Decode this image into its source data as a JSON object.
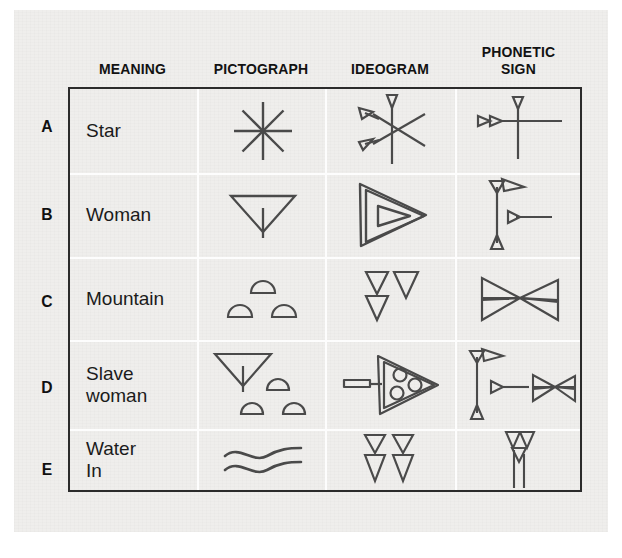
{
  "figure": {
    "type": "cuneiform-evolution-table",
    "headers": {
      "row_label": "",
      "meaning": "MEANING",
      "pictograph": "PICTOGRAPH",
      "ideogram": "IDEOGRAM",
      "phonetic_sign_line1": "PHONETIC",
      "phonetic_sign_line2": "SIGN"
    },
    "colors": {
      "paper": "#efeeec",
      "ink": "#2b2b2b",
      "grid": "#fdfdfd",
      "text": "#1b1b1b"
    },
    "rows": [
      {
        "letter": "A",
        "meaning": "Star",
        "meaning_line1": "Star",
        "meaning_line2": "",
        "pictograph": "eight-pointed-asterisk",
        "ideogram": "wedge-star-six-ray",
        "phonetic": "cross-with-two-wedges"
      },
      {
        "letter": "B",
        "meaning": "Woman",
        "meaning_line1": "Woman",
        "meaning_line2": "",
        "pictograph": "down-triangle-with-stroke",
        "ideogram": "nested-right-triangle",
        "phonetic": "vertical-stroke-with-wedges"
      },
      {
        "letter": "C",
        "meaning": "Mountain",
        "meaning_line1": "Mountain",
        "meaning_line2": "",
        "pictograph": "three-domes",
        "ideogram": "three-down-wedges",
        "phonetic": "bowtie-wedges"
      },
      {
        "letter": "D",
        "meaning": "Slave woman",
        "meaning_line1": "Slave",
        "meaning_line2": "woman",
        "pictograph": "triangle-and-three-domes",
        "ideogram": "arrow-triangle-three-circles",
        "phonetic": "woman-plus-mountain-signs"
      },
      {
        "letter": "E",
        "meaning": "Water In",
        "meaning_line1": "Water",
        "meaning_line2": "In",
        "pictograph": "double-wavy-line",
        "ideogram": "four-wedges-two-columns",
        "phonetic": "two-wedges-two-verticals"
      }
    ]
  }
}
